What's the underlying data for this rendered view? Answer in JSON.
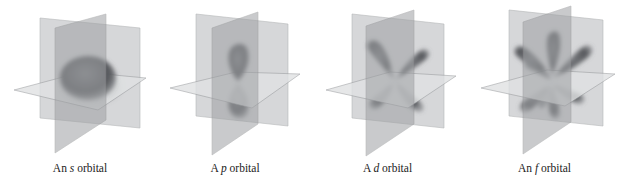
{
  "figure": {
    "colors": {
      "back_plane": "#c9cbcd",
      "front_plane": "#9a9c9f",
      "horizontal_plane": "#dcdedf",
      "plane_edge": "#8a8c8e",
      "lobe": "#5a5c60"
    },
    "panels": [
      {
        "id": "s",
        "orbital_type": "s",
        "shape": "sphere",
        "lobe_count": 1,
        "caption": {
          "prefix": "An ",
          "letter": "s",
          "suffix": " orbital"
        }
      },
      {
        "id": "p",
        "orbital_type": "p",
        "shape": "dumbbell",
        "lobe_count": 2,
        "caption": {
          "prefix": "A ",
          "letter": "p",
          "suffix": " orbital"
        }
      },
      {
        "id": "d",
        "orbital_type": "d",
        "shape": "four-leaf clover",
        "lobe_count": 4,
        "caption": {
          "prefix": "A ",
          "letter": "d",
          "suffix": " orbital"
        }
      },
      {
        "id": "f",
        "orbital_type": "f",
        "shape": "multi-lobed",
        "lobe_count": 8,
        "caption": {
          "prefix": "An ",
          "letter": "f",
          "suffix": " orbital"
        }
      }
    ]
  }
}
